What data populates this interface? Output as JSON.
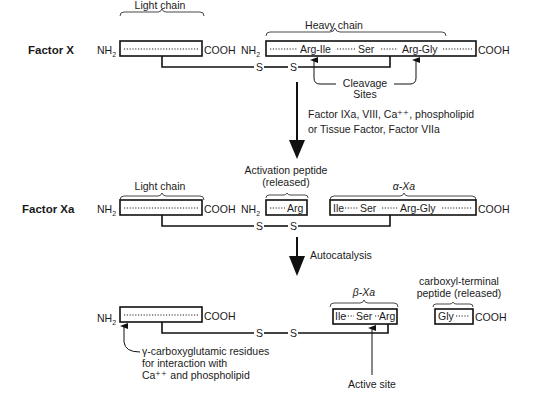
{
  "rows": {
    "factor_x": {
      "label": "Factor X",
      "light_chain_label": "Light chain",
      "heavy_chain_label": "Heavy chain",
      "nh2": "NH",
      "nh2_sub": "2",
      "cooh": "COOH",
      "heavy_residues": [
        "Arg-Ile",
        "Ser",
        "Arg-Gly"
      ],
      "disulfide": [
        "S",
        "S"
      ],
      "cleavage_label_1": "Cleavage",
      "cleavage_label_2": "Sites"
    },
    "factor_xa": {
      "label": "Factor Xa",
      "light_chain_label": "Light chain",
      "activation_peptide_label_1": "Activation peptide",
      "activation_peptide_label_2": "(released)",
      "activation_residue": "Arg",
      "alpha_label": "α-Xa",
      "alpha_residues": [
        "Ile",
        "Ser",
        "Arg-Gly"
      ],
      "nh2": "NH",
      "nh2_sub": "2",
      "cooh": "COOH",
      "disulfide": [
        "S",
        "S"
      ]
    },
    "beta": {
      "beta_label": "β-Xa",
      "beta_residues": [
        "Ile",
        "Ser",
        "Arg"
      ],
      "carboxyl_label_1": "carboxyl-terminal",
      "carboxyl_label_2": "peptide (released)",
      "carboxyl_residue": "Gly",
      "nh2": "NH",
      "nh2_sub": "2",
      "cooh": "COOH",
      "disulfide": [
        "S",
        "S"
      ],
      "gla_note": [
        "γ-carboxyglutamic residues",
        "for interaction with",
        "Ca⁺⁺ and phospholipid"
      ],
      "active_site_label": "Active site"
    }
  },
  "transitions": {
    "first": [
      "Factor IXa, VIII, Ca⁺⁺, phospholipid",
      "or Tissue Factor, Factor VIIa"
    ],
    "second": "Autocatalysis"
  }
}
